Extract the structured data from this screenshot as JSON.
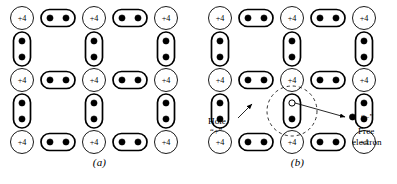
{
  "figure": {
    "background_color": "#ffffff",
    "ink_color": "#000000",
    "width": 397,
    "height": 184
  },
  "panels": [
    {
      "id": "a",
      "caption": "(a)",
      "core_label": "+4",
      "description": "intrinsic silicon lattice with complete covalent bonds",
      "cores": [
        {
          "col": 1,
          "row": 1
        },
        {
          "col": 3,
          "row": 1
        },
        {
          "col": 5,
          "row": 1
        },
        {
          "col": 1,
          "row": 3
        },
        {
          "col": 3,
          "row": 3
        },
        {
          "col": 5,
          "row": 3
        },
        {
          "col": 1,
          "row": 5
        },
        {
          "col": 3,
          "row": 5
        },
        {
          "col": 5,
          "row": 5
        }
      ],
      "horizontal_bonds": [
        {
          "col": 2,
          "row": 1
        },
        {
          "col": 4,
          "row": 1
        },
        {
          "col": 2,
          "row": 3
        },
        {
          "col": 4,
          "row": 3
        },
        {
          "col": 2,
          "row": 5
        },
        {
          "col": 4,
          "row": 5
        }
      ],
      "vertical_bonds": [
        {
          "col": 1,
          "row": 2
        },
        {
          "col": 3,
          "row": 2
        },
        {
          "col": 5,
          "row": 2
        },
        {
          "col": 1,
          "row": 4
        },
        {
          "col": 3,
          "row": 4
        },
        {
          "col": 5,
          "row": 4
        }
      ],
      "hole": null,
      "free_electron": null,
      "annotations": []
    },
    {
      "id": "b",
      "caption": "(b)",
      "core_label": "+4",
      "description": "lattice with a broken covalent bond producing a hole and a free electron",
      "cores": [
        {
          "col": 1,
          "row": 1
        },
        {
          "col": 3,
          "row": 1
        },
        {
          "col": 5,
          "row": 1
        },
        {
          "col": 1,
          "row": 3
        },
        {
          "col": 3,
          "row": 3
        },
        {
          "col": 5,
          "row": 3
        },
        {
          "col": 1,
          "row": 5
        },
        {
          "col": 3,
          "row": 5
        },
        {
          "col": 5,
          "row": 5
        }
      ],
      "horizontal_bonds": [
        {
          "col": 2,
          "row": 1
        },
        {
          "col": 4,
          "row": 1
        },
        {
          "col": 2,
          "row": 3
        },
        {
          "col": 4,
          "row": 3
        },
        {
          "col": 2,
          "row": 5
        },
        {
          "col": 4,
          "row": 5
        }
      ],
      "vertical_bonds": [
        {
          "col": 1,
          "row": 2
        },
        {
          "col": 3,
          "row": 2
        },
        {
          "col": 5,
          "row": 2
        },
        {
          "col": 1,
          "row": 4
        },
        {
          "col": 3,
          "row": 4
        },
        {
          "col": 5,
          "row": 4
        }
      ],
      "hole": {
        "col": 3,
        "row": 4,
        "position": "top",
        "filled": false
      },
      "free_electron": {
        "filled": true
      },
      "annotations": [
        {
          "name": "hole-label",
          "line1": "Hole",
          "line2": "“+”"
        },
        {
          "name": "free-electron-label",
          "line1": "Free",
          "line2": "electron",
          "marker": "“−”"
        }
      ]
    }
  ],
  "geometry": {
    "core_radius": 11.5,
    "bond_h_width": 34,
    "bond_h_height": 17,
    "bond_v_width": 17,
    "bond_v_height": 34,
    "dot_radius": 3.1,
    "col_x": [
      22,
      58,
      94,
      130,
      166
    ],
    "row_y": [
      18,
      49,
      80,
      111,
      142
    ],
    "dashed_circle_radius": 25
  }
}
